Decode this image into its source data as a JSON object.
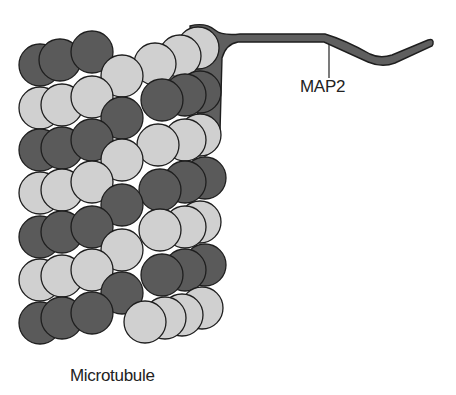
{
  "labels": {
    "map2": "MAP2",
    "microtubule": "Microtubule"
  },
  "colors": {
    "dark": "#5a5a5a",
    "light": "#d0d0d0",
    "stroke": "#1e1e1e",
    "map2_fill": "#5f5f5f",
    "background": "#ffffff"
  },
  "circles": [
    {
      "x": 40,
      "y": 65,
      "c": "dark"
    },
    {
      "x": 60,
      "y": 60,
      "c": "dark"
    },
    {
      "x": 92,
      "y": 52,
      "c": "dark"
    },
    {
      "x": 198,
      "y": 48,
      "c": "light"
    },
    {
      "x": 180,
      "y": 56,
      "c": "light"
    },
    {
      "x": 155,
      "y": 64,
      "c": "light"
    },
    {
      "x": 122,
      "y": 76,
      "c": "light"
    },
    {
      "x": 200,
      "y": 92,
      "c": "dark"
    },
    {
      "x": 185,
      "y": 95,
      "c": "dark"
    },
    {
      "x": 162,
      "y": 100,
      "c": "dark"
    },
    {
      "x": 40,
      "y": 108,
      "c": "light"
    },
    {
      "x": 62,
      "y": 105,
      "c": "light"
    },
    {
      "x": 92,
      "y": 97,
      "c": "light"
    },
    {
      "x": 122,
      "y": 118,
      "c": "dark"
    },
    {
      "x": 200,
      "y": 135,
      "c": "light"
    },
    {
      "x": 185,
      "y": 140,
      "c": "light"
    },
    {
      "x": 158,
      "y": 145,
      "c": "light"
    },
    {
      "x": 40,
      "y": 150,
      "c": "dark"
    },
    {
      "x": 62,
      "y": 148,
      "c": "dark"
    },
    {
      "x": 92,
      "y": 140,
      "c": "dark"
    },
    {
      "x": 122,
      "y": 160,
      "c": "light"
    },
    {
      "x": 205,
      "y": 178,
      "c": "dark"
    },
    {
      "x": 185,
      "y": 182,
      "c": "dark"
    },
    {
      "x": 160,
      "y": 190,
      "c": "dark"
    },
    {
      "x": 40,
      "y": 193,
      "c": "light"
    },
    {
      "x": 62,
      "y": 190,
      "c": "light"
    },
    {
      "x": 92,
      "y": 182,
      "c": "light"
    },
    {
      "x": 122,
      "y": 205,
      "c": "dark"
    },
    {
      "x": 200,
      "y": 222,
      "c": "light"
    },
    {
      "x": 185,
      "y": 227,
      "c": "light"
    },
    {
      "x": 160,
      "y": 230,
      "c": "light"
    },
    {
      "x": 40,
      "y": 237,
      "c": "dark"
    },
    {
      "x": 62,
      "y": 232,
      "c": "dark"
    },
    {
      "x": 92,
      "y": 227,
      "c": "dark"
    },
    {
      "x": 122,
      "y": 250,
      "c": "light"
    },
    {
      "x": 205,
      "y": 265,
      "c": "dark"
    },
    {
      "x": 185,
      "y": 270,
      "c": "dark"
    },
    {
      "x": 162,
      "y": 275,
      "c": "dark"
    },
    {
      "x": 40,
      "y": 280,
      "c": "light"
    },
    {
      "x": 62,
      "y": 276,
      "c": "light"
    },
    {
      "x": 92,
      "y": 270,
      "c": "light"
    },
    {
      "x": 122,
      "y": 293,
      "c": "dark"
    },
    {
      "x": 202,
      "y": 308,
      "c": "light"
    },
    {
      "x": 182,
      "y": 315,
      "c": "light"
    },
    {
      "x": 165,
      "y": 318,
      "c": "light"
    },
    {
      "x": 40,
      "y": 323,
      "c": "dark"
    },
    {
      "x": 62,
      "y": 318,
      "c": "dark"
    },
    {
      "x": 92,
      "y": 313,
      "c": "dark"
    },
    {
      "x": 145,
      "y": 322,
      "c": "light"
    }
  ],
  "circle_radius": 21
}
